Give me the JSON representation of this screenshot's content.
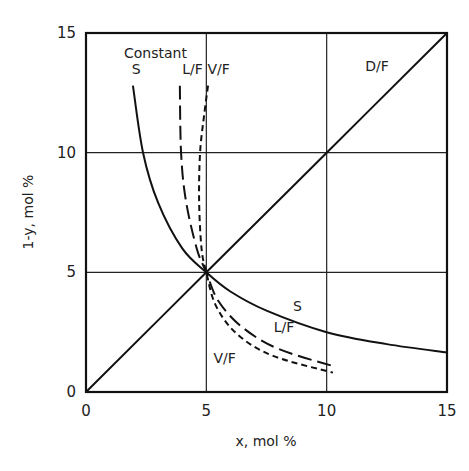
{
  "chart_data": {
    "type": "line",
    "title": "",
    "xlabel": "x, mol %",
    "ylabel": "1-y, mol %",
    "xlim": [
      0,
      15
    ],
    "ylim": [
      0,
      15
    ],
    "xticks": [
      0,
      5,
      10,
      15
    ],
    "yticks": [
      0,
      5,
      10,
      15
    ],
    "grid": true,
    "legend": "inline labels",
    "annotation": "Constant",
    "series": [
      {
        "name": "D/F",
        "style": "solid",
        "label_pos": [
          11.6,
          13.4
        ],
        "x": [
          0,
          5,
          10,
          15
        ],
        "y": [
          0,
          5,
          10,
          15
        ]
      },
      {
        "name": "S",
        "style": "solid",
        "label_pos": [
          1.9,
          13.3
        ],
        "label_pos_2": [
          8.6,
          3.4
        ],
        "x": [
          1.95,
          2.37,
          3.0,
          4.0,
          5.0,
          6.0,
          7.5,
          10.0,
          12.5,
          15.0
        ],
        "y": [
          12.8,
          10.0,
          7.9,
          6.0,
          5.0,
          4.2,
          3.4,
          2.5,
          2.0,
          1.65
        ]
      },
      {
        "name": "L/F",
        "style": "long-dash",
        "label_pos": [
          4.0,
          13.3
        ],
        "label_pos_2": [
          7.8,
          2.5
        ],
        "x": [
          3.9,
          3.95,
          4.15,
          4.6,
          5.0,
          5.5,
          6.5,
          8.0,
          10.35
        ],
        "y": [
          12.8,
          10.0,
          8.0,
          6.0,
          5.0,
          3.8,
          2.7,
          1.8,
          1.06
        ]
      },
      {
        "name": "V/F",
        "style": "short-dash",
        "label_pos": [
          5.05,
          13.3
        ],
        "label_pos_2": [
          5.3,
          1.2
        ],
        "x": [
          5.07,
          4.9,
          4.74,
          4.7,
          4.8,
          5.0,
          5.4,
          6.3,
          7.8,
          10.26
        ],
        "y": [
          12.8,
          11.5,
          10.0,
          8.0,
          6.0,
          5.0,
          3.6,
          2.4,
          1.5,
          0.81
        ]
      }
    ]
  }
}
